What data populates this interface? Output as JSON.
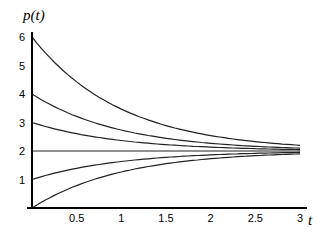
{
  "chart_data": {
    "type": "line",
    "title": "",
    "xlabel": "t",
    "ylabel": "p(t)",
    "xlim": [
      0,
      3
    ],
    "ylim": [
      0,
      6
    ],
    "x_ticks": [
      "0.5",
      "1",
      "1.5",
      "2",
      "2.5",
      "3"
    ],
    "y_ticks": [
      "1",
      "2",
      "3",
      "4",
      "5",
      "6"
    ],
    "grid": false,
    "legend": "none",
    "series": [
      {
        "name": "p0=6",
        "x": [
          0,
          0.5,
          1,
          1.5,
          2,
          2.5,
          3
        ],
        "values": [
          6,
          4.43,
          3.47,
          2.89,
          2.54,
          2.33,
          2.2
        ]
      },
      {
        "name": "p0=4",
        "x": [
          0,
          0.5,
          1,
          1.5,
          2,
          2.5,
          3
        ],
        "values": [
          4,
          3.21,
          2.74,
          2.45,
          2.27,
          2.16,
          2.1
        ]
      },
      {
        "name": "p0=3",
        "x": [
          0,
          0.5,
          1,
          1.5,
          2,
          2.5,
          3
        ],
        "values": [
          3,
          2.61,
          2.37,
          2.22,
          2.14,
          2.08,
          2.05
        ]
      },
      {
        "name": "p0=2",
        "x": [
          0,
          0.5,
          1,
          1.5,
          2,
          2.5,
          3
        ],
        "values": [
          2,
          2,
          2,
          2,
          2,
          2,
          2
        ]
      },
      {
        "name": "p0=1",
        "x": [
          0,
          0.5,
          1,
          1.5,
          2,
          2.5,
          3
        ],
        "values": [
          1,
          1.39,
          1.63,
          1.78,
          1.86,
          1.92,
          1.95
        ]
      },
      {
        "name": "p0=0",
        "x": [
          0,
          0.5,
          1,
          1.5,
          2,
          2.5,
          3
        ],
        "values": [
          0,
          0.79,
          1.26,
          1.55,
          1.73,
          1.84,
          1.9
        ]
      }
    ]
  }
}
